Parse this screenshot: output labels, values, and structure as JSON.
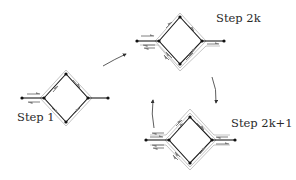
{
  "figure": {
    "labels": {
      "step1": "Step 1",
      "step2k": "Step 2k",
      "step2k1": "Step 2k+1"
    },
    "colors": {
      "edge": "#1a1a1a",
      "node": "#111111",
      "path_outline": "#b8b8b8",
      "flow_arrow": "#808080",
      "transition_arrow": "#333333"
    },
    "panels": [
      {
        "id": "step1",
        "label_key": "step1",
        "label_pos": [
          17,
          112
        ],
        "nodes": {
          "ext_left": [
            22,
            98
          ],
          "left": [
            44,
            98
          ],
          "top": [
            66,
            74
          ],
          "right": [
            88,
            98
          ],
          "bottom": [
            66,
            122
          ],
          "ext_right": [
            108,
            98
          ]
        },
        "outline_layers": 1
      },
      {
        "id": "step2k",
        "label_key": "step2k",
        "label_pos": [
          216,
          13
        ],
        "nodes": {
          "ext_left": [
            137,
            41
          ],
          "left": [
            159,
            41
          ],
          "top": [
            180,
            17
          ],
          "right": [
            202,
            41
          ],
          "bottom": [
            180,
            64
          ],
          "ext_right": [
            224,
            41
          ]
        },
        "outline_layers": 2
      },
      {
        "id": "step2k1",
        "label_key": "step2k1",
        "label_pos": [
          231,
          118
        ],
        "nodes": {
          "ext_left": [
            146,
            140
          ],
          "left": [
            169,
            140
          ],
          "top": [
            190,
            117
          ],
          "right": [
            212,
            140
          ],
          "bottom": [
            190,
            163
          ],
          "ext_right": [
            235,
            140
          ]
        },
        "outline_layers": 3
      }
    ],
    "transitions": [
      {
        "from": "step1",
        "to": "step2k",
        "direction": "up-right"
      },
      {
        "from": "step2k",
        "to": "step2k1",
        "direction": "down"
      },
      {
        "from": "step2k1",
        "to": "step2k",
        "direction": "up"
      }
    ]
  }
}
